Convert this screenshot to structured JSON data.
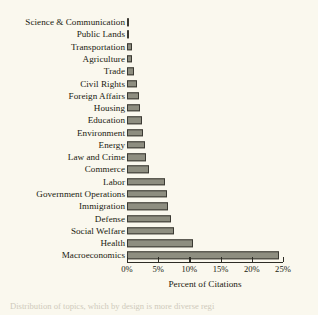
{
  "figure": {
    "background_color": "#faf8ee",
    "bar_fill_color": "#8e8e80",
    "bar_border_color": "#3b3a33",
    "axis_color": "#2e2d26",
    "caption_bleed": "Distribution of topics, which by design is more diverse regi"
  },
  "chart_data": {
    "type": "bar",
    "orientation": "horizontal",
    "title": "",
    "xlabel": "Percent of Citations",
    "ylabel": "",
    "xlim": [
      0,
      25
    ],
    "grid": false,
    "legend": null,
    "tick_labels": [
      "0%",
      "5%",
      "10%",
      "15%",
      "20%",
      "25%"
    ],
    "tick_values": [
      0,
      5,
      10,
      15,
      20,
      25
    ],
    "categories": [
      "Science & Communication",
      "Public Lands",
      "Transportation",
      "Agriculture",
      "Trade",
      "Civil Rights",
      "Foreign Affairs",
      "Housing",
      "Education",
      "Environment",
      "Energy",
      "Law and Crime",
      "Commerce",
      "Labor",
      "Government Operations",
      "Immigration",
      "Defense",
      "Social Welfare",
      "Health",
      "Macroeconomics"
    ],
    "values": [
      0.3,
      0.3,
      0.8,
      0.8,
      1.1,
      1.6,
      1.9,
      2.1,
      2.4,
      2.5,
      2.9,
      3.1,
      3.5,
      6.1,
      6.4,
      6.5,
      7.0,
      7.6,
      10.5,
      24.3
    ]
  }
}
